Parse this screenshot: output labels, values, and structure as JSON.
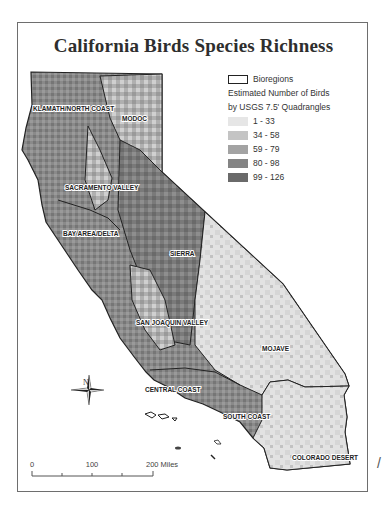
{
  "map": {
    "title": "California Birds Species Richness",
    "legend": {
      "boundary_label": "Bioregions",
      "heading_line1": "Estimated Number of Birds",
      "heading_line2": "by USGS 7.5' Quadrangles",
      "classes": [
        {
          "label": "1 - 33",
          "color": "#e6e6e6"
        },
        {
          "label": "34 - 58",
          "color": "#c4c4c4"
        },
        {
          "label": "59 - 79",
          "color": "#a3a3a3"
        },
        {
          "label": "80 - 98",
          "color": "#848484"
        },
        {
          "label": "99 - 126",
          "color": "#6a6a6a"
        }
      ]
    },
    "regions": [
      {
        "name": "KLAMATH/NORTH COAST"
      },
      {
        "name": "MODOC"
      },
      {
        "name": "SACRAMENTO VALLEY"
      },
      {
        "name": "BAY AREA/DELTA"
      },
      {
        "name": "SIERRA"
      },
      {
        "name": "SAN JOAQUIN VALLEY"
      },
      {
        "name": "MOJAVE"
      },
      {
        "name": "CENTRAL COAST"
      },
      {
        "name": "SOUTH COAST"
      },
      {
        "name": "COLORADO DESERT"
      }
    ],
    "north_arrow": {
      "label": "N"
    },
    "scale_bar": {
      "ticks": [
        "0",
        "100",
        "200 Miles"
      ]
    }
  }
}
